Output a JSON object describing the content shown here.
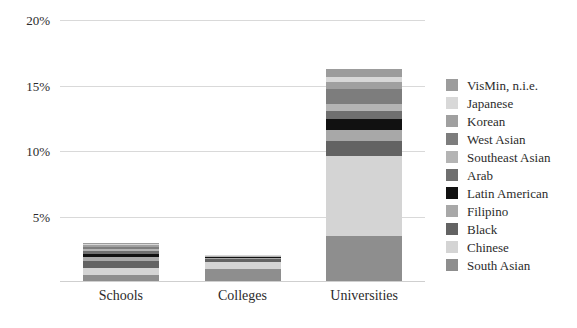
{
  "chart_data": {
    "type": "bar",
    "subtype": "stacked-bar",
    "title": "",
    "xlabel": "",
    "ylabel": "",
    "categories": [
      "Schools",
      "Colleges",
      "Universities"
    ],
    "ylim": [
      0,
      20
    ],
    "ytick_values": [
      5,
      10,
      15,
      20
    ],
    "ytick_labels": [
      "5%",
      "10%",
      "15%",
      "20%"
    ],
    "grid": true,
    "legend_position": "right",
    "value_unit": "%",
    "stack_order_bottom_to_top": [
      "South Asian",
      "Chinese",
      "Black",
      "Filipino",
      "Latin American",
      "Arab",
      "Southeast Asian",
      "West Asian",
      "Korean",
      "Japanese",
      "VisMin, n.i.e."
    ],
    "series": [
      {
        "name": "South Asian",
        "color": "#8e8e8e",
        "values": [
          0.45,
          0.95,
          3.45
        ]
      },
      {
        "name": "Chinese",
        "color": "#d4d4d4",
        "values": [
          0.55,
          0.5,
          6.1
        ]
      },
      {
        "name": "Black",
        "color": "#636363",
        "values": [
          0.5,
          0.2,
          1.15
        ]
      },
      {
        "name": "Filipino",
        "color": "#a8a8a8",
        "values": [
          0.35,
          0.1,
          0.85
        ]
      },
      {
        "name": "Latin American",
        "color": "#111111",
        "values": [
          0.25,
          0.05,
          0.85
        ]
      },
      {
        "name": "Arab",
        "color": "#6f6f6f",
        "values": [
          0.2,
          0.05,
          0.6
        ]
      },
      {
        "name": "Southeast Asian",
        "color": "#b4b4b4",
        "values": [
          0.18,
          0.05,
          0.55
        ]
      },
      {
        "name": "West Asian",
        "color": "#7d7d7d",
        "values": [
          0.15,
          0.03,
          1.1
        ]
      },
      {
        "name": "Korean",
        "color": "#a0a0a0",
        "values": [
          0.12,
          0.02,
          0.55
        ]
      },
      {
        "name": "Japanese",
        "color": "#d8d8d8",
        "values": [
          0.08,
          0.02,
          0.35
        ]
      },
      {
        "name": "VisMin, n.i.e.",
        "color": "#9c9c9c",
        "values": [
          0.1,
          0.03,
          0.65
        ]
      }
    ],
    "totals": [
      2.93,
      2.0,
      16.2
    ]
  },
  "legend": {
    "items": [
      {
        "label": "VisMin, n.i.e.",
        "color": "#9c9c9c"
      },
      {
        "label": "Japanese",
        "color": "#d8d8d8"
      },
      {
        "label": "Korean",
        "color": "#a0a0a0"
      },
      {
        "label": "West Asian",
        "color": "#7d7d7d"
      },
      {
        "label": "Southeast Asian",
        "color": "#b4b4b4"
      },
      {
        "label": "Arab",
        "color": "#6f6f6f"
      },
      {
        "label": "Latin American",
        "color": "#111111"
      },
      {
        "label": "Filipino",
        "color": "#a8a8a8"
      },
      {
        "label": "Black",
        "color": "#636363"
      },
      {
        "label": "Chinese",
        "color": "#d4d4d4"
      },
      {
        "label": "South Asian",
        "color": "#8e8e8e"
      }
    ]
  },
  "axes": {
    "gridline_color": "#d9d9d9",
    "text_color": "#2b2b2b"
  }
}
